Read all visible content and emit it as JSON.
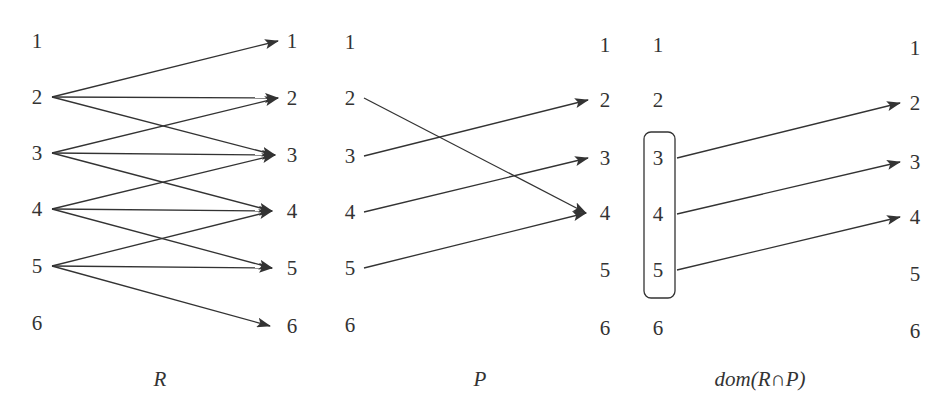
{
  "nodes": [
    "1",
    "2",
    "3",
    "4",
    "5",
    "6"
  ],
  "colors": {
    "ink": "#333333",
    "background": "#ffffff"
  },
  "panels": [
    {
      "id": "R",
      "caption": "R",
      "left_x": 37,
      "right_x": 292,
      "left_y": [
        41,
        97,
        153,
        209,
        266,
        323
      ],
      "right_y": [
        41,
        98,
        155,
        211,
        268,
        326
      ],
      "edge_start_x": 52,
      "edge_end_x": [
        278,
        278,
        275,
        272,
        272,
        270
      ],
      "caption_x": 160,
      "edges": [
        [
          2,
          1
        ],
        [
          2,
          2
        ],
        [
          2,
          3
        ],
        [
          3,
          2
        ],
        [
          3,
          3
        ],
        [
          3,
          4
        ],
        [
          4,
          3
        ],
        [
          4,
          4
        ],
        [
          4,
          5
        ],
        [
          5,
          4
        ],
        [
          5,
          5
        ],
        [
          5,
          6
        ]
      ]
    },
    {
      "id": "P",
      "caption": "P",
      "left_x": 350,
      "right_x": 605,
      "left_y": [
        42,
        98,
        156,
        212,
        268,
        325
      ],
      "right_y": [
        45,
        100,
        158,
        213,
        270,
        328
      ],
      "edge_start_x": 364,
      "edge_end_x": [
        588,
        588,
        588,
        586,
        588,
        588
      ],
      "caption_x": 480,
      "edges": [
        [
          2,
          4
        ],
        [
          3,
          2
        ],
        [
          4,
          3
        ],
        [
          5,
          4
        ]
      ]
    },
    {
      "id": "domRP",
      "caption": "dom(R∩P)",
      "left_x": 658,
      "right_x": 915,
      "left_y": [
        45,
        100,
        158,
        214,
        270,
        328
      ],
      "right_y": [
        48,
        103,
        162,
        217,
        274,
        331
      ],
      "edge_start_x": 677,
      "edge_end_x": [
        900,
        900,
        900,
        900,
        900,
        900
      ],
      "caption_x": 760,
      "edges": [
        [
          3,
          2
        ],
        [
          4,
          3
        ],
        [
          5,
          4
        ]
      ],
      "highlight_box": {
        "x": 644,
        "y": 132,
        "width": 31,
        "height": 166,
        "rx": 7,
        "nodes": [
          "3",
          "4",
          "5"
        ]
      }
    }
  ],
  "caption_y": 386
}
